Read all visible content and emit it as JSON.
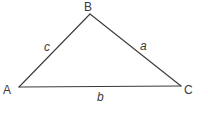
{
  "diagram": {
    "type": "triangle",
    "vertices": [
      {
        "id": "A",
        "label": "A",
        "x": 19,
        "y": 87
      },
      {
        "id": "B",
        "label": "B",
        "x": 90,
        "y": 14
      },
      {
        "id": "C",
        "label": "C",
        "x": 181,
        "y": 86
      }
    ],
    "sides": [
      {
        "id": "c",
        "label": "c",
        "from": "A",
        "to": "B"
      },
      {
        "id": "a",
        "label": "a",
        "from": "B",
        "to": "C"
      },
      {
        "id": "b",
        "label": "b",
        "from": "A",
        "to": "C"
      }
    ],
    "colors": {
      "line": "#3a3a3a",
      "text": "#3a3a3a",
      "background": "#ffffff"
    }
  }
}
